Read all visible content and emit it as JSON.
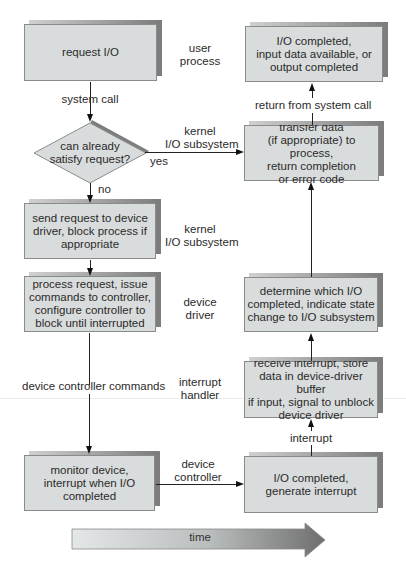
{
  "boxes": {
    "request_io": "request I/O",
    "decision": [
      "can already",
      "satisfy request?"
    ],
    "send_request": [
      "send request to device",
      "driver, block process if",
      "appropriate"
    ],
    "process_request": [
      "process request, issue",
      "commands to controller,",
      "configure controller to",
      "block until interrupted"
    ],
    "monitor_device": [
      "monitor device,",
      "interrupt when I/O",
      "completed"
    ],
    "io_completed_generate": [
      "I/O completed,",
      "generate interrupt"
    ],
    "receive_interrupt": [
      "receive interrupt, store",
      "data in device-driver buffer",
      "if input, signal to unblock",
      "device driver"
    ],
    "determine_io": [
      "determine which I/O",
      "completed, indicate state",
      "change to I/O subsystem"
    ],
    "transfer_data": [
      "transfer data",
      "(if appropriate) to process,",
      "return completion",
      "or error code"
    ],
    "io_completed_final": [
      "I/O completed,",
      "input data available, or",
      "output completed"
    ]
  },
  "layer_labels": {
    "user_process": [
      "user",
      "process"
    ],
    "kernel_io_1": [
      "kernel",
      "I/O subsystem"
    ],
    "kernel_io_2": [
      "kernel",
      "I/O subsystem"
    ],
    "device_driver": [
      "device",
      "driver"
    ],
    "interrupt_handler": [
      "interrupt",
      "handler"
    ],
    "device_controller": [
      "device",
      "controller"
    ]
  },
  "edge_labels": {
    "system_call": "system call",
    "yes": "yes",
    "no": "no",
    "device_controller_commands": "device controller commands",
    "interrupt": "interrupt",
    "return_from_system_call": "return from system call"
  },
  "time_arrow": {
    "label": "time"
  },
  "colors": {
    "box_fill": "#d9dcdc",
    "shadow": "#7d7d7d",
    "line": "#222222"
  }
}
